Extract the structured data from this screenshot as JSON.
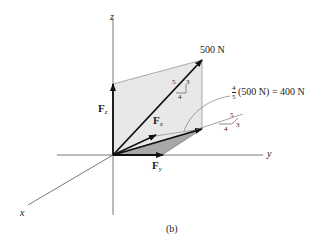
{
  "figure": {
    "caption": "(b)",
    "axes": {
      "x": "x",
      "y": "y",
      "z": "z"
    },
    "force": {
      "label": "500 N",
      "slope_triangle": {
        "hyp": "5",
        "rise": "3",
        "run": "4"
      }
    },
    "components": {
      "Fz": {
        "letter": "F",
        "sub": "z"
      },
      "Fx": {
        "letter": "F",
        "sub": "x"
      },
      "Fy": {
        "letter": "F",
        "sub": "y"
      }
    },
    "projection": {
      "frac_num": "4",
      "frac_den": "5",
      "expression": "(500 N) = 400 N",
      "slope_triangle": {
        "hyp": "5",
        "rise": "3",
        "run": "4"
      }
    },
    "colors": {
      "plane_light": "#e6e6e6",
      "plane_dark": "#a8a8a8",
      "axis": "#555555",
      "arrow": "#111111"
    }
  }
}
